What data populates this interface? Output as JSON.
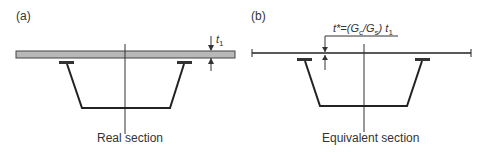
{
  "panels": [
    {
      "tag": "(a)",
      "caption": "Real section",
      "dimension_label": "t",
      "dimension_sub": "1"
    },
    {
      "tag": "(b)",
      "caption": "Equivalent section",
      "formula": {
        "lhs": "t*=(G",
        "sub1": "c",
        "mid": "/G",
        "sub2": "s",
        "rhs": ") t",
        "sub3": "1"
      }
    }
  ],
  "colors": {
    "slab_fill": "#b8b8b8",
    "line": "#222222"
  }
}
